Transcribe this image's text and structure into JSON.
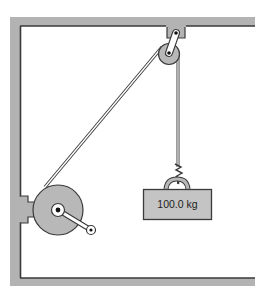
{
  "diagram": {
    "title": "",
    "weight_label": "100.0 kg",
    "components": [
      {
        "name": "frame",
        "description": "rectangular wall/ceiling frame (gray)"
      },
      {
        "name": "ceiling-bracket",
        "description": "bracket mounted on ceiling holding pulley arm"
      },
      {
        "name": "pulley",
        "description": "small pulley suspended from ceiling bracket"
      },
      {
        "name": "winch-drum",
        "description": "large drum mounted on left wall"
      },
      {
        "name": "crank-handle",
        "description": "crank arm attached to winch drum"
      },
      {
        "name": "rope",
        "description": "rope from winch drum over pulley down to weight"
      },
      {
        "name": "hook",
        "description": "hook and ring attaching rope to weight"
      },
      {
        "name": "weight",
        "description": "block mass"
      }
    ],
    "colors": {
      "frame_gray": "#b0b0b0",
      "outline": "#333333",
      "part_fill": "#b8b8b8",
      "weight_fill": "#c4c4c4",
      "background": "#ffffff"
    }
  }
}
